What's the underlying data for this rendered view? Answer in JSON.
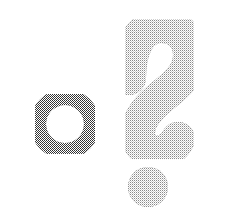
{
  "image": {
    "title": "Question mark and ring symbol",
    "description": "A scanned black-and-white halftone drawing showing a dark gray ring (letter O) beside a large light gray question mark.",
    "width": 229,
    "height": 215,
    "background_color": "#ffffff",
    "rendering": "halftone-dither",
    "media": "scanned-bitmap"
  },
  "palette": {
    "background": "#ffffff",
    "dark_gray": "#5a5a5a",
    "light_gray": "#a8a8a8",
    "dither_dark_ink": "#3c3c3c",
    "dither_light_ink": "#8e8e8e"
  },
  "shapes": [
    {
      "id": "ring",
      "name": "O",
      "kind": "ring",
      "color": "#5a5a5a",
      "center_x": 65,
      "center_y": 124,
      "outer_diameter": 70,
      "inner_diameter": 38,
      "stroke_width": 16
    },
    {
      "id": "question-hook",
      "name": "?",
      "kind": "question-mark-hook",
      "color": "#a8a8a8",
      "left": 112,
      "top": 8,
      "right": 207,
      "bottom": 165,
      "stroke_width": 34
    },
    {
      "id": "question-dot",
      "name": "? dot",
      "kind": "circle",
      "color": "#a8a8a8",
      "center_x": 148,
      "center_y": 187,
      "diameter": 40
    }
  ]
}
